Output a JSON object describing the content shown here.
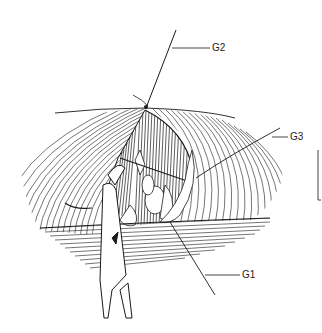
{
  "figure": {
    "labels": [
      {
        "id": "G2",
        "text": "G2",
        "x": 212,
        "y": 43
      },
      {
        "id": "G3",
        "text": "G3",
        "x": 290,
        "y": 132
      },
      {
        "id": "G1",
        "text": "G1",
        "x": 242,
        "y": 272
      }
    ],
    "scale_bar": {
      "x": 318,
      "y1": 150,
      "y2": 200
    },
    "colors": {
      "ink": "#1a1a1a",
      "background": "#ffffff",
      "label": "#222222"
    }
  }
}
